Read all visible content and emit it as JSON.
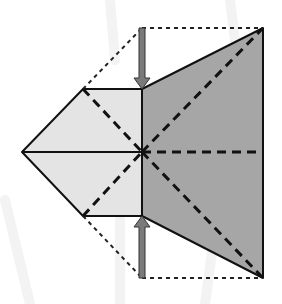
{
  "diagram": {
    "type": "origami-fold-step",
    "colors": {
      "background": "#ffffff",
      "light_face": "#e4e4e4",
      "dark_face": "#a6a6a6",
      "outline": "#111111",
      "valley_fold": "#111111",
      "hidden_edge": "#222222",
      "arrow_fill": "#7a7a7a",
      "watermark": "#f3f3f3"
    },
    "points": {
      "left_tip": [
        22,
        152
      ],
      "light_top": [
        83,
        89
      ],
      "light_bottom": [
        83,
        216
      ],
      "center_top": [
        142,
        89
      ],
      "center": [
        142,
        152
      ],
      "center_bottom": [
        142,
        216
      ],
      "dark_top_right": [
        263,
        28
      ],
      "dark_bottom_right": [
        263,
        278
      ],
      "dark_right_mid": [
        263,
        152
      ],
      "ghost_top_left": [
        142,
        28
      ],
      "ghost_bottom_left": [
        142,
        278
      ]
    },
    "arrows": [
      {
        "name": "arrow-down",
        "from": [
          142,
          28
        ],
        "to": [
          142,
          89
        ]
      },
      {
        "name": "arrow-up",
        "from": [
          142,
          278
        ],
        "to": [
          142,
          216
        ]
      }
    ]
  }
}
